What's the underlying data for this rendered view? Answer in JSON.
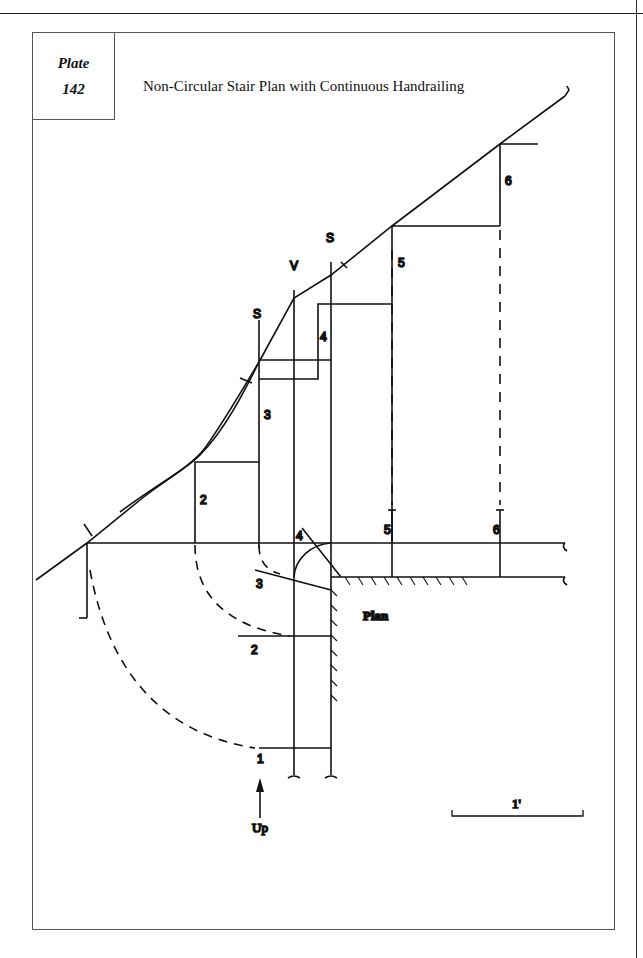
{
  "plate": {
    "label": "Plate",
    "number": "142",
    "title": "Non-Circular Stair Plan with Continuous Handrailing"
  },
  "drawing": {
    "line_labels": {
      "spring_left": "S",
      "vertical": "V",
      "spring_right": "S"
    },
    "elevation_step_numbers": [
      "2",
      "3",
      "4",
      "5",
      "6"
    ],
    "plan_step_numbers": [
      "1",
      "2",
      "3",
      "4",
      "5",
      "6"
    ],
    "plan_label": "Plan",
    "direction_label": "Up",
    "scale_label": "1'"
  },
  "colors": {
    "ink": "#111111",
    "frame": "#555555",
    "paper": "#ffffff"
  }
}
